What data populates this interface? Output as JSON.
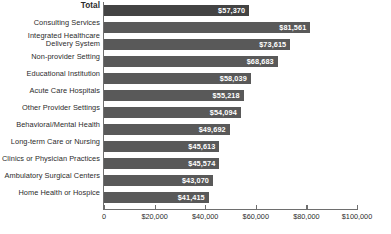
{
  "chart_data": {
    "type": "bar",
    "orientation": "horizontal",
    "title": "",
    "subtitle": "",
    "xlabel": "",
    "ylabel": "",
    "xlim": [
      0,
      100000
    ],
    "grid": false,
    "legend": null,
    "xticks": [
      0,
      20000,
      40000,
      60000,
      80000,
      100000
    ],
    "xtick_labels": [
      "0",
      "$20,000",
      "$40,000",
      "$60,000",
      "$80,000",
      "$100,000"
    ],
    "categories": [
      "Total",
      "Consulting Services",
      "Integrated Healthcare\nDelivery System",
      "Non-provider Setting",
      "Educational Institution",
      "Acute Care Hospitals",
      "Other Provider Settings",
      "Behavioral/Mental Health",
      "Long-term Care or Nursing",
      "Clinics or Physician Practices",
      "Ambulatory Surgical Centers",
      "Home Health or Hospice"
    ],
    "values": [
      57370,
      81561,
      73615,
      68683,
      58039,
      55218,
      54094,
      49692,
      45613,
      45574,
      43070,
      41415
    ],
    "value_labels": [
      "$57,370",
      "$81,561",
      "$73,615",
      "$68,683",
      "$58,039",
      "$55,218",
      "$54,094",
      "$49,692",
      "$45,613",
      "$45,574",
      "$43,070",
      "$41,415"
    ],
    "colors": {
      "bar": "#595959",
      "bar_total": "#434343",
      "axis": "#6e6e6e",
      "text": "#2b2b2b",
      "value_text": "#ffffff",
      "background": "#ffffff"
    },
    "emphasis_index": 0
  }
}
